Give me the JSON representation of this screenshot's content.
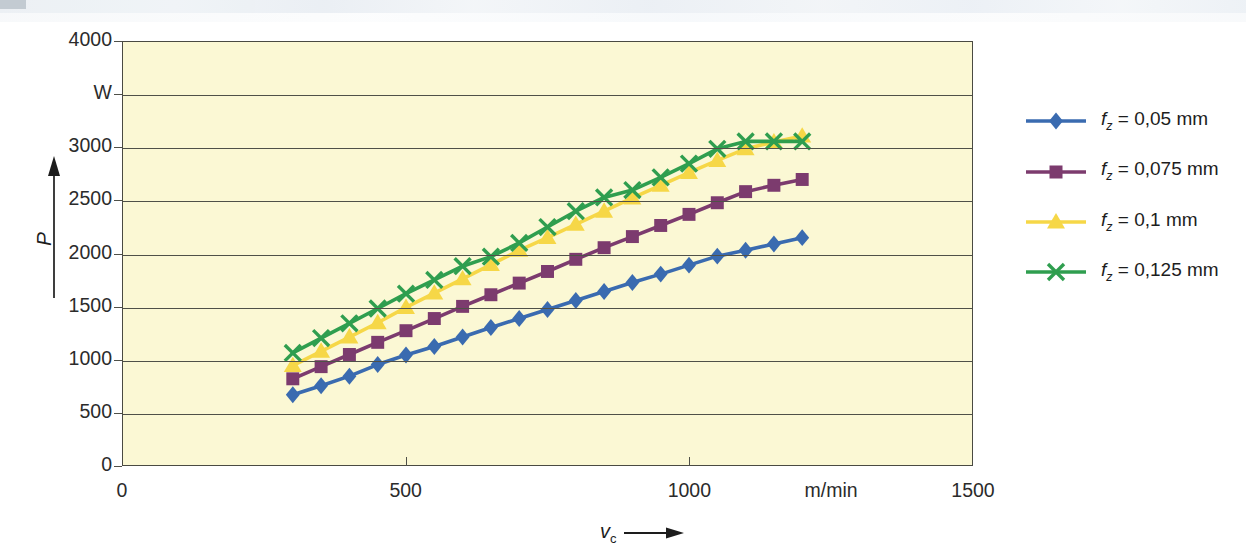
{
  "chart_data": {
    "type": "line",
    "title": "",
    "xlabel": "v_c",
    "ylabel": "P",
    "xunit": "m/min",
    "yunit": "W",
    "xlim": [
      0,
      1500
    ],
    "ylim": [
      0,
      4000
    ],
    "x_ticks": [
      "0",
      "500",
      "1000",
      "1500"
    ],
    "x_tick_values": [
      0,
      500,
      1000,
      1500
    ],
    "x_unit_label_position": 1250,
    "y_ticks": [
      "0",
      "500",
      "1000",
      "1500",
      "2000",
      "2500",
      "3000",
      "4000"
    ],
    "y_tick_values": [
      0,
      500,
      1000,
      1500,
      2000,
      2500,
      3000,
      4000
    ],
    "y_unit_label_position": 3500,
    "grid": true,
    "grid_axis": "y",
    "legend_position": "right",
    "plot_background": "#fbf8d4",
    "x": [
      300,
      350,
      400,
      450,
      500,
      550,
      600,
      650,
      700,
      750,
      800,
      850,
      900,
      950,
      1000,
      1050,
      1100,
      1150,
      1200
    ],
    "series": [
      {
        "name": "f_z = 0,05 mm",
        "label": "f<sub>z</sub> = 0,05 mm",
        "color": "#3a6bb0",
        "marker": "diamond",
        "values": [
          665,
          750,
          840,
          950,
          1040,
          1120,
          1210,
          1300,
          1385,
          1470,
          1555,
          1640,
          1725,
          1805,
          1890,
          1975,
          2030,
          2090,
          2150
        ]
      },
      {
        "name": "f_z = 0,075 mm",
        "label": "f<sub>z</sub> = 0,075 mm",
        "color": "#7c3b6e",
        "marker": "square",
        "values": [
          815,
          930,
          1045,
          1160,
          1270,
          1385,
          1500,
          1610,
          1720,
          1830,
          1945,
          2055,
          2160,
          2265,
          2370,
          2480,
          2585,
          2645,
          2700
        ]
      },
      {
        "name": "f_z = 0,1 mm",
        "label": "f<sub>z</sub> = 0,1 mm",
        "color": "#f6d747",
        "marker": "triangle",
        "values": [
          940,
          1075,
          1210,
          1345,
          1490,
          1625,
          1760,
          1895,
          2030,
          2150,
          2275,
          2400,
          2525,
          2645,
          2765,
          2880,
          2990,
          3055,
          3110
        ]
      },
      {
        "name": "f_z = 0,125 mm",
        "label": "f<sub>z</sub> = 0,125 mm",
        "color": "#2f9e4f",
        "marker": "cross",
        "values": [
          1060,
          1200,
          1340,
          1480,
          1620,
          1750,
          1880,
          1970,
          2100,
          2250,
          2400,
          2530,
          2600,
          2720,
          2850,
          2990,
          3060,
          3060,
          3060
        ]
      }
    ]
  },
  "axes": {
    "y_unit": "W",
    "y_name": "P",
    "x_unit": "m/min",
    "x_name": "v",
    "x_name_sub": "c"
  }
}
